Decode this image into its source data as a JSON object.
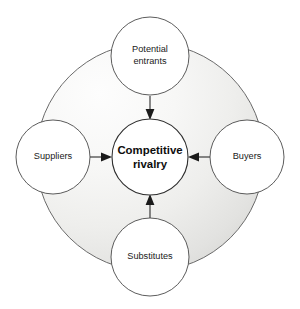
{
  "diagram": {
    "center": {
      "name": "competitive-rivalry",
      "line1": "Competitive",
      "line2": "rivalry"
    },
    "forces": [
      {
        "name": "potential-entrants",
        "position": "top",
        "line1": "Potential",
        "line2": "entrants"
      },
      {
        "name": "suppliers",
        "position": "left",
        "line1": "Suppliers",
        "line2": ""
      },
      {
        "name": "buyers",
        "position": "right",
        "line1": "Buyers",
        "line2": ""
      },
      {
        "name": "substitutes",
        "position": "bottom",
        "line1": "Substitutes",
        "line2": ""
      }
    ],
    "arrows": [
      {
        "name": "arrow-entrants-to-rivalry",
        "direction": "down"
      },
      {
        "name": "arrow-suppliers-to-rivalry",
        "direction": "right"
      },
      {
        "name": "arrow-buyers-to-rivalry",
        "direction": "left"
      },
      {
        "name": "arrow-substitutes-to-rivalry",
        "direction": "up"
      }
    ],
    "colors": {
      "page_background": "#ffffff",
      "backdrop_light": "#fbfbfb",
      "backdrop_mid": "#f0f0ef",
      "backdrop_dark": "#d9d9d7",
      "circle_fill": "#ffffff",
      "circle_stroke": "#4a4a4a",
      "text": "#1a1a1a",
      "arrow": "#1a1a1a"
    }
  }
}
